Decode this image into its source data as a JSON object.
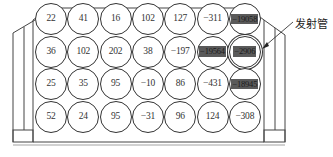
{
  "figure": {
    "label": "发射管",
    "colors": {
      "line": "#333333",
      "highlight": "#5a5a5a",
      "background": "#ffffff"
    },
    "grid": {
      "rows": 4,
      "cols": 7,
      "values": [
        [
          "22",
          "41",
          "16",
          "102",
          "127",
          "−311",
          "−19058"
        ],
        [
          "36",
          "102",
          "202",
          "38",
          "−197",
          "−19564",
          "−2906"
        ],
        [
          "25",
          "35",
          "95",
          "−10",
          "86",
          "−431",
          "−18945"
        ],
        [
          "52",
          "24",
          "95",
          "−31",
          "96",
          "124",
          "−308"
        ]
      ],
      "highlighted": [
        [
          0,
          6
        ],
        [
          1,
          5
        ],
        [
          1,
          6
        ],
        [
          2,
          6
        ]
      ],
      "emitter_cell": [
        1,
        6
      ]
    }
  }
}
